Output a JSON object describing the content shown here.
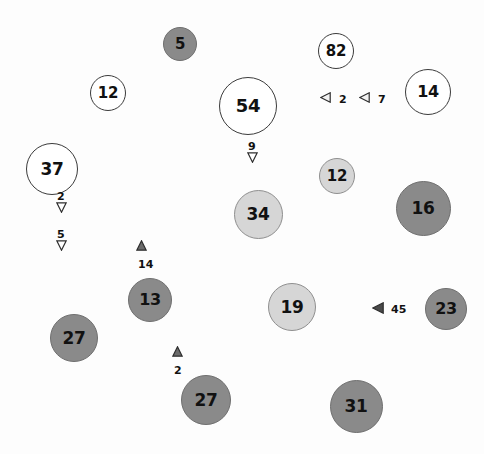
{
  "figure": {
    "type": "bubble-map",
    "width": 484,
    "height": 454,
    "background": "#fdfdfd"
  },
  "palette": {
    "white_fill": "#ffffff",
    "white_stroke": "#3b3b3b",
    "light_fill": "#d6d6d6",
    "light_stroke": "#8f8f8f",
    "dark_fill": "#8a8a8a",
    "dark_stroke": "#6f6f6f",
    "text": "#111111"
  },
  "chart_data": {
    "type": "scatter",
    "title": "",
    "xlabel": "",
    "ylabel": "",
    "grid": false,
    "legend": null,
    "bubbles": [
      {
        "label": "5",
        "value": 5,
        "x": 180,
        "y": 44,
        "d": 34,
        "shade": "dark",
        "font": 15
      },
      {
        "label": "82",
        "value": 82,
        "x": 336,
        "y": 51,
        "d": 36,
        "shade": "white",
        "font": 15
      },
      {
        "label": "12",
        "value": 12,
        "x": 108,
        "y": 93,
        "d": 36,
        "shade": "white",
        "font": 15
      },
      {
        "label": "14",
        "value": 14,
        "x": 428,
        "y": 92,
        "d": 46,
        "shade": "white",
        "font": 16
      },
      {
        "label": "54",
        "value": 54,
        "x": 248,
        "y": 106,
        "d": 58,
        "shade": "white",
        "font": 18
      },
      {
        "label": "37",
        "value": 37,
        "x": 52,
        "y": 169,
        "d": 52,
        "shade": "white",
        "font": 17
      },
      {
        "label": "12",
        "value": 12,
        "x": 337,
        "y": 176,
        "d": 36,
        "shade": "light",
        "font": 15
      },
      {
        "label": "16",
        "value": 16,
        "x": 423,
        "y": 208,
        "d": 55,
        "shade": "dark",
        "font": 17
      },
      {
        "label": "34",
        "value": 34,
        "x": 258,
        "y": 214,
        "d": 49,
        "shade": "light",
        "font": 17
      },
      {
        "label": "13",
        "value": 13,
        "x": 150,
        "y": 300,
        "d": 44,
        "shade": "dark",
        "font": 16
      },
      {
        "label": "19",
        "value": 19,
        "x": 292,
        "y": 307,
        "d": 48,
        "shade": "light",
        "font": 17
      },
      {
        "label": "23",
        "value": 23,
        "x": 446,
        "y": 309,
        "d": 42,
        "shade": "dark",
        "font": 16
      },
      {
        "label": "27",
        "value": 27,
        "x": 74,
        "y": 338,
        "d": 48,
        "shade": "dark",
        "font": 17
      },
      {
        "label": "27",
        "value": 27,
        "x": 206,
        "y": 400,
        "d": 50,
        "shade": "dark",
        "font": 17
      },
      {
        "label": "31",
        "value": 31,
        "x": 356,
        "y": 406,
        "d": 53,
        "shade": "dark",
        "font": 17
      }
    ],
    "markers": [
      {
        "label": "2",
        "value": 2,
        "x": 56,
        "y": 202,
        "dir": "down",
        "size": 11,
        "font": 11
      },
      {
        "label": "5",
        "value": 5,
        "x": 56,
        "y": 240,
        "dir": "down",
        "size": 11,
        "font": 11
      },
      {
        "label": "9",
        "value": 9,
        "x": 247,
        "y": 152,
        "dir": "down",
        "size": 11,
        "font": 11
      },
      {
        "label": "2",
        "value": 2,
        "x": 320,
        "y": 92,
        "dir": "left",
        "size": 11,
        "font": 11
      },
      {
        "label": "7",
        "value": 7,
        "x": 359,
        "y": 92,
        "dir": "left",
        "size": 11,
        "font": 11
      },
      {
        "label": "14",
        "value": 14,
        "x": 136,
        "y": 240,
        "dir": "up",
        "size": 11,
        "font": 11
      },
      {
        "label": "2",
        "value": 2,
        "x": 172,
        "y": 346,
        "dir": "up",
        "size": 11,
        "font": 11
      },
      {
        "label": "45",
        "value": 45,
        "x": 372,
        "y": 302,
        "dir": "left",
        "size": 12,
        "font": 11
      }
    ]
  }
}
